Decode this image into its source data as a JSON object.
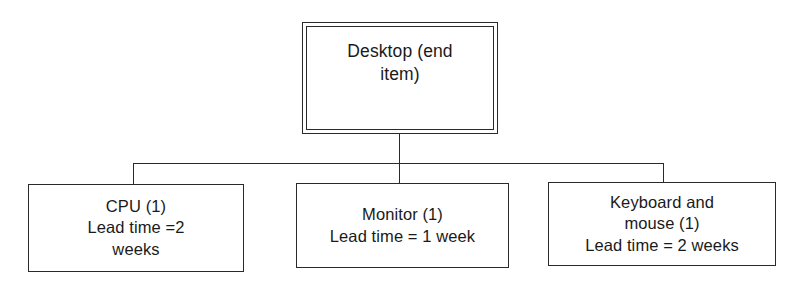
{
  "diagram": {
    "type": "bill-of-materials-tree",
    "orientation": "top-down",
    "line_color": "#2a2a2a",
    "background_color": "#ffffff",
    "root": {
      "id": "root",
      "label": "Desktop (end\nitem)",
      "name": "Desktop",
      "descriptor": "end item",
      "border_style": "double"
    },
    "children": [
      {
        "id": "cpu",
        "label": "CPU (1)\nLead time =2\nweeks",
        "name": "CPU",
        "quantity": "1",
        "lead_time": "2 weeks",
        "border_style": "single"
      },
      {
        "id": "monitor",
        "label": "Monitor (1)\nLead time = 1 week",
        "name": "Monitor",
        "quantity": "1",
        "lead_time": "1 week",
        "border_style": "single"
      },
      {
        "id": "keyboard",
        "label": "Keyboard and\nmouse (1)\nLead time = 2 weeks",
        "name": "Keyboard and mouse",
        "quantity": "1",
        "lead_time": "2 weeks",
        "border_style": "single"
      }
    ]
  }
}
